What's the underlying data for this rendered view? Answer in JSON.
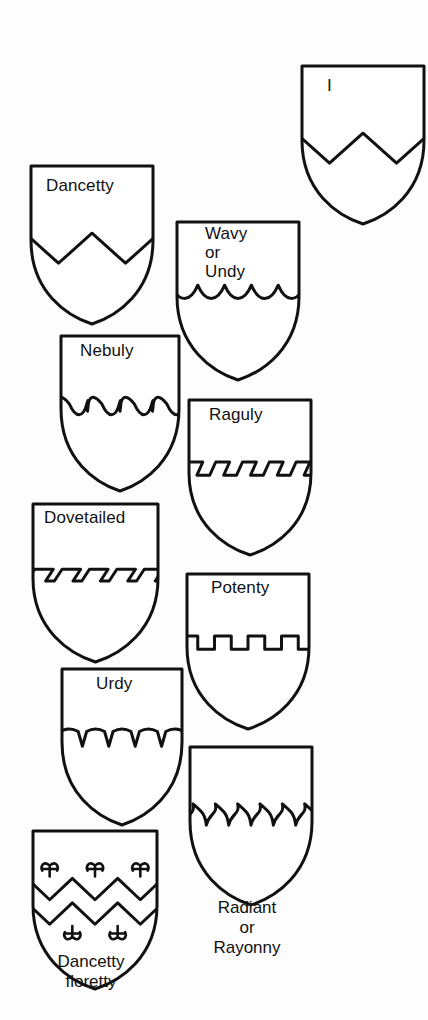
{
  "figure": {
    "background_color": "#fdfdfd",
    "ink_color": "#111111"
  },
  "shields": [
    {
      "id": "dancetty",
      "label": "Dancetty",
      "label_lines": "Dancetty",
      "pattern": "dancetty",
      "caption": "",
      "x": 27,
      "y": 162,
      "w": 122,
      "h": 158,
      "label_x": 46,
      "label_y": 176,
      "clipped": false
    },
    {
      "id": "wavy-or-undy",
      "label": "Wavy or Undy",
      "label_lines": "Wavy\nor\nUndy",
      "pattern": "wavy",
      "caption": "",
      "x": 173,
      "y": 218,
      "w": 122,
      "h": 158,
      "label_x": 205,
      "label_y": 224,
      "clipped": false
    },
    {
      "id": "nebuly",
      "label": "Nebuly",
      "label_lines": "Nebuly",
      "pattern": "nebuly",
      "caption": "",
      "x": 57,
      "y": 332,
      "w": 118,
      "h": 155,
      "label_x": 80,
      "label_y": 341,
      "clipped": false
    },
    {
      "id": "raguly",
      "label": "Raguly",
      "label_lines": "Raguly",
      "pattern": "raguly",
      "caption": "",
      "x": 185,
      "y": 396,
      "w": 122,
      "h": 155,
      "label_x": 209,
      "label_y": 405,
      "clipped": false
    },
    {
      "id": "dovetailed",
      "label": "Dovetailed",
      "label_lines": "Dovetailed",
      "pattern": "dovetailed",
      "caption": "",
      "x": 29,
      "y": 500,
      "w": 125,
      "h": 158,
      "label_x": 44,
      "label_y": 508,
      "clipped": false
    },
    {
      "id": "potenty",
      "label": "Potenty",
      "label_lines": "Potenty",
      "pattern": "potenty",
      "caption": "",
      "x": 183,
      "y": 570,
      "w": 122,
      "h": 155,
      "label_x": 211,
      "label_y": 578,
      "clipped": false
    },
    {
      "id": "urdy",
      "label": "Urdy",
      "label_lines": "Urdy",
      "pattern": "urdy",
      "caption": "",
      "x": 58,
      "y": 665,
      "w": 120,
      "h": 156,
      "label_x": 96,
      "label_y": 674,
      "clipped": false
    },
    {
      "id": "radiant-or-rayonny",
      "label": "Radiant or Rayonny",
      "label_lines": "",
      "pattern": "radiant",
      "caption": "Radiant\nor\nRayonny",
      "x": 186,
      "y": 743,
      "w": 122,
      "h": 158,
      "caption_x": 186,
      "caption_y": 898,
      "clipped": false
    },
    {
      "id": "dancetty-floretty",
      "label": "Dancetty floretty",
      "label_lines": "",
      "pattern": "dancetty-floretty",
      "caption": "Dancetty\nfloretty",
      "x": 29,
      "y": 827,
      "w": 124,
      "h": 158,
      "caption_x": 29,
      "caption_y": 952,
      "clipped": false
    },
    {
      "id": "partial-top-right",
      "label": "I",
      "label_lines": "I",
      "pattern": "dancetty",
      "caption": "",
      "x": 298,
      "y": 62,
      "w": 122,
      "h": 158,
      "label_x": 327,
      "label_y": 76,
      "clipped": true
    }
  ]
}
